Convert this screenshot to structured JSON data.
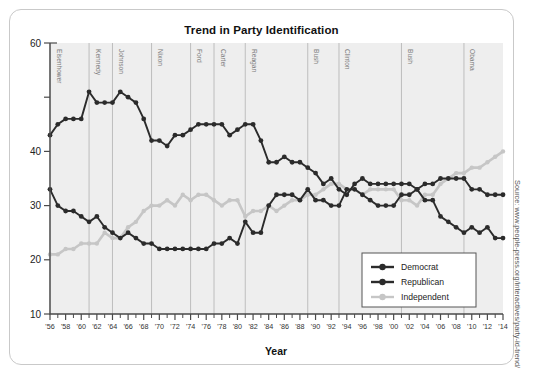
{
  "card": {
    "title": "Trend in Party Identification",
    "source": "Source: www.people-press.org/interactives/party-id-trend/"
  },
  "axes": {
    "xlabel": "Year",
    "ylabel": "",
    "y_ticks": [
      "60",
      "40",
      "30",
      "20",
      "10"
    ],
    "x_ticks": [
      "'56",
      "'58",
      "'60",
      "'62",
      "'64",
      "'66",
      "'68",
      "'70",
      "'72",
      "'74",
      "'76",
      "'78",
      "'80",
      "'82",
      "'84",
      "'86",
      "'88",
      "'90",
      "'92",
      "'94",
      "'96",
      "'98",
      "'00",
      "'02",
      "'04",
      "'06",
      "'08",
      "'10",
      "'12",
      "'14"
    ]
  },
  "legend": {
    "items": [
      {
        "label": "Democrat",
        "color": "#2b2b2b"
      },
      {
        "label": "Republican",
        "color": "#2b2b2b"
      },
      {
        "label": "Independent",
        "color": "#c6c6c6"
      }
    ]
  },
  "presidents": [
    {
      "name": "Eisenhower",
      "year": 1956
    },
    {
      "name": "Kennedy",
      "year": 1961
    },
    {
      "name": "Johnson",
      "year": 1964
    },
    {
      "name": "Nixon",
      "year": 1969
    },
    {
      "name": "Ford",
      "year": 1974
    },
    {
      "name": "Carter",
      "year": 1977
    },
    {
      "name": "Reagan",
      "year": 1981
    },
    {
      "name": "Bush",
      "year": 1989
    },
    {
      "name": "Clinton",
      "year": 1993
    },
    {
      "name": "Bush",
      "year": 2001
    },
    {
      "name": "Obama",
      "year": 2009
    }
  ],
  "chart_data": {
    "type": "line",
    "title": "Trend in Party Identification",
    "xlabel": "Year",
    "ylabel": "",
    "xlim": [
      1956,
      2014
    ],
    "ylim": [
      10,
      60
    ],
    "grid": false,
    "legend_position": "bottom-right",
    "x": [
      1956,
      1957,
      1958,
      1959,
      1960,
      1961,
      1962,
      1963,
      1964,
      1965,
      1966,
      1967,
      1968,
      1969,
      1970,
      1971,
      1972,
      1973,
      1974,
      1975,
      1976,
      1977,
      1978,
      1979,
      1980,
      1981,
      1982,
      1983,
      1984,
      1985,
      1986,
      1987,
      1988,
      1989,
      1990,
      1991,
      1992,
      1993,
      1994,
      1995,
      1996,
      1997,
      1998,
      1999,
      2000,
      2001,
      2002,
      2003,
      2004,
      2005,
      2006,
      2007,
      2008,
      2009,
      2010,
      2011,
      2012,
      2013,
      2014
    ],
    "series": [
      {
        "name": "Democrat",
        "color": "#2b2b2b",
        "values": [
          43,
          45,
          46,
          46,
          46,
          51,
          49,
          49,
          49,
          51,
          50,
          49,
          46,
          42,
          42,
          41,
          43,
          43,
          44,
          45,
          45,
          45,
          45,
          43,
          44,
          45,
          45,
          42,
          38,
          38,
          39,
          38,
          38,
          37,
          36,
          34,
          35,
          33,
          32,
          34,
          35,
          34,
          34,
          34,
          34,
          34,
          34,
          33,
          34,
          34,
          35,
          35,
          35,
          35,
          33,
          33,
          32,
          32,
          32
        ]
      },
      {
        "name": "Republican",
        "color": "#2b2b2b",
        "values": [
          33,
          30,
          29,
          29,
          28,
          27,
          28,
          26,
          25,
          24,
          25,
          24,
          23,
          23,
          22,
          22,
          22,
          22,
          22,
          22,
          22,
          23,
          23,
          24,
          23,
          27,
          25,
          25,
          30,
          32,
          32,
          32,
          31,
          33,
          31,
          31,
          30,
          30,
          33,
          33,
          32,
          31,
          30,
          30,
          30,
          32,
          32,
          33,
          31,
          31,
          28,
          27,
          26,
          25,
          26,
          25,
          26,
          24,
          24
        ]
      },
      {
        "name": "Independent",
        "color": "#c6c6c6",
        "values": [
          21,
          21,
          22,
          22,
          23,
          23,
          23,
          25,
          24,
          24,
          26,
          27,
          29,
          30,
          30,
          31,
          30,
          32,
          31,
          32,
          32,
          31,
          30,
          31,
          31,
          28,
          29,
          29,
          30,
          29,
          30,
          31,
          31,
          32,
          32,
          33,
          34,
          34,
          33,
          33,
          32,
          33,
          33,
          33,
          33,
          31,
          31,
          30,
          32,
          32,
          34,
          35,
          36,
          36,
          37,
          37,
          38,
          39,
          40
        ]
      }
    ]
  }
}
